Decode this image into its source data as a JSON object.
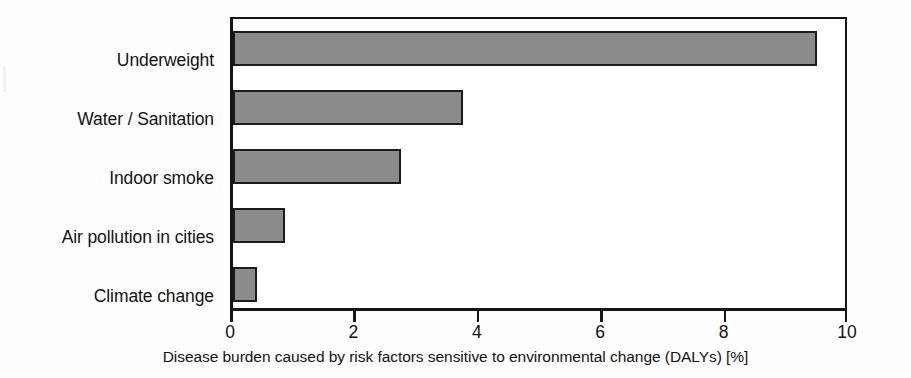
{
  "chart_data": {
    "type": "bar",
    "orientation": "horizontal",
    "title": "",
    "xlabel": "Disease burden caused by risk factors sensitive to environmental change (DALYs) [%]",
    "ylabel": "",
    "categories": [
      "Underweight",
      "Water / Sanitation",
      "Indoor smoke",
      "Air pollution in cities",
      "Climate change"
    ],
    "values": [
      9.55,
      3.75,
      2.75,
      0.85,
      0.4
    ],
    "xlim": [
      0,
      10
    ],
    "ylim_categories": 5,
    "xticks": [
      0,
      2,
      4,
      6,
      8,
      10
    ],
    "xticklabels": [
      "0",
      "2",
      "4",
      "6",
      "8",
      "10"
    ],
    "grid": false,
    "legend": null,
    "units": "%",
    "colors": {
      "bar_fill": "#8b8b8b",
      "bar_edge": "#1b1b1b",
      "axis": "#151515",
      "text": "#121212",
      "background": "#ffffff"
    }
  }
}
